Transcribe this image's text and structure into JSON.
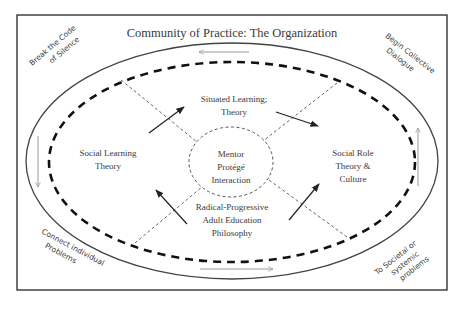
{
  "title": "Community of Practice: The Organization",
  "corners": {
    "top_left": [
      "Break the Code",
      "of Silence"
    ],
    "top_right": [
      "Begin Collective",
      "Dialogue"
    ],
    "bottom_left": [
      "Connect individual",
      "Problems"
    ],
    "bottom_right": [
      "To Societal or",
      "systemic",
      "problems"
    ]
  },
  "nodes": {
    "top": [
      "Situated Learning;",
      "Theory"
    ],
    "left": [
      "Social Learning",
      "Theory"
    ],
    "right": [
      "Social Role",
      "Theory &",
      "Culture"
    ],
    "bottom": [
      "Radical-Progressive",
      "Adult Education",
      "Philosophy"
    ],
    "center": [
      "Mentor",
      "Protégé",
      "Interaction"
    ]
  },
  "colors": {
    "border": "#333333",
    "ellipse": "#444444",
    "dashed": "#111111",
    "cycle_arrows": "#9a9a9a",
    "text": "#3a3a3a"
  }
}
